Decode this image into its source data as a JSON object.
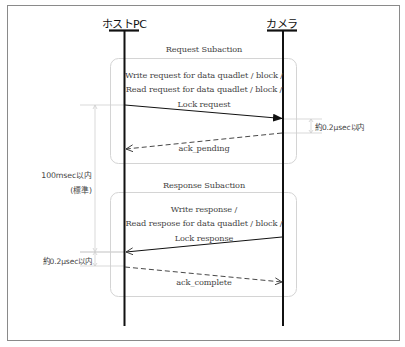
{
  "diagram": {
    "type": "sequence",
    "actors": [
      {
        "id": "host",
        "label": "ホストPC"
      },
      {
        "id": "camera",
        "label": "カメラ"
      }
    ],
    "request_subaction": {
      "title": "Request Subaction",
      "message_lines": [
        "Write request for data quadlet / block /",
        "Read request for data quadlet / block /",
        "Lock request"
      ],
      "from": "host",
      "to": "camera",
      "ack_label": "ack_pending",
      "ack_from": "camera",
      "ack_to": "host",
      "timing_label": "約0.2μsec以内"
    },
    "response_subaction": {
      "title": "Response Subaction",
      "message_lines": [
        "Write response /",
        "Read respose for data quadlet / block /",
        "Lock response"
      ],
      "from": "camera",
      "to": "host",
      "ack_label": "ack_complete",
      "ack_from": "host",
      "ack_to": "camera",
      "timing_label": "約0.2μsec以内"
    },
    "overall_timing": {
      "label": "100msec以内",
      "sublabel": "(標準)"
    },
    "colors": {
      "lifeline": "#111111",
      "box_border": "#cfcfcf",
      "frame_border": "#8a8a8a",
      "text": "#444444",
      "dimension_line": "#c8c8c8"
    }
  }
}
